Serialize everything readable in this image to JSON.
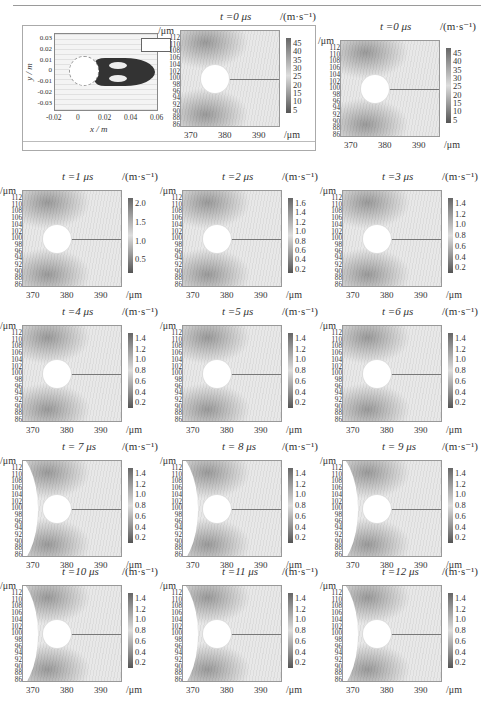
{
  "figure": {
    "inset": {
      "x_label": "x / m",
      "y_label": "y / m",
      "x_ticks": [
        "-0.02",
        "0",
        "0.02",
        "0.04",
        "0.06"
      ],
      "y_ticks": [
        "0.03",
        "0.02",
        "0.01",
        "0",
        "-0.01",
        "-0.02",
        "-0.03"
      ]
    },
    "common": {
      "y_unit": "/μm",
      "x_unit": "/μm",
      "cbar_unit": "/(m·s⁻¹)",
      "y_ticks": [
        "112",
        "110",
        "108",
        "106",
        "104",
        "102",
        "100",
        "98",
        "96",
        "94",
        "92",
        "90",
        "88",
        "86"
      ],
      "x_ticks": [
        "370",
        "380",
        "390"
      ]
    },
    "panels": [
      {
        "title": "t =0 μs",
        "cbar_ticks": [
          "45",
          "40",
          "35",
          "30",
          "25",
          "20",
          "15",
          "10",
          "5"
        ],
        "wall": false
      },
      {
        "title": "t =0 μs",
        "cbar_ticks": [
          "45",
          "40",
          "35",
          "30",
          "25",
          "20",
          "15",
          "10",
          "5"
        ],
        "wall": false
      },
      {
        "title": "t =1 μs",
        "cbar_ticks": [
          "2.0",
          "1.5",
          "1.0",
          "0.5"
        ],
        "wall": false
      },
      {
        "title": "t =2 μs",
        "cbar_ticks": [
          "1.6",
          "1.4",
          "1.2",
          "1.0",
          "0.8",
          "0.6",
          "0.4",
          "0.2"
        ],
        "wall": false
      },
      {
        "title": "t =3 μs",
        "cbar_ticks": [
          "1.4",
          "1.2",
          "1.0",
          "0.8",
          "0.6",
          "0.4",
          "0.2"
        ],
        "wall": false
      },
      {
        "title": "t =4 μs",
        "cbar_ticks": [
          "1.4",
          "1.2",
          "1.0",
          "0.8",
          "0.6",
          "0.4",
          "0.2"
        ],
        "wall": false
      },
      {
        "title": "t =5 μs",
        "cbar_ticks": [
          "1.4",
          "1.2",
          "1.0",
          "0.8",
          "0.6",
          "0.4",
          "0.2"
        ],
        "wall": false
      },
      {
        "title": "t =6 μs",
        "cbar_ticks": [
          "1.4",
          "1.2",
          "1.0",
          "0.8",
          "0.6",
          "0.4",
          "0.2"
        ],
        "wall": false
      },
      {
        "title": "t = 7 μs",
        "cbar_ticks": [
          "1.4",
          "1.2",
          "1.0",
          "0.8",
          "0.6",
          "0.4",
          "0.2"
        ],
        "wall": true
      },
      {
        "title": "t = 8 μs",
        "cbar_ticks": [
          "1.4",
          "1.2",
          "1.0",
          "0.8",
          "0.6",
          "0.4",
          "0.2"
        ],
        "wall": true
      },
      {
        "title": "t = 9 μs",
        "cbar_ticks": [
          "1.4",
          "1.2",
          "1.0",
          "0.8",
          "0.6",
          "0.4",
          "0.2"
        ],
        "wall": true
      },
      {
        "title": "t =10 μs",
        "cbar_ticks": [
          "1.4",
          "1.2",
          "1.0",
          "0.8",
          "0.6",
          "0.4",
          "0.2"
        ],
        "wall": true
      },
      {
        "title": "t =11 μs",
        "cbar_ticks": [
          "1.4",
          "1.2",
          "1.0",
          "0.8",
          "0.6",
          "0.4",
          "0.2"
        ],
        "wall": true
      },
      {
        "title": "t =12 μs",
        "cbar_ticks": [
          "1.4",
          "1.2",
          "1.0",
          "0.8",
          "0.6",
          "0.4",
          "0.2"
        ],
        "wall": true
      }
    ]
  }
}
